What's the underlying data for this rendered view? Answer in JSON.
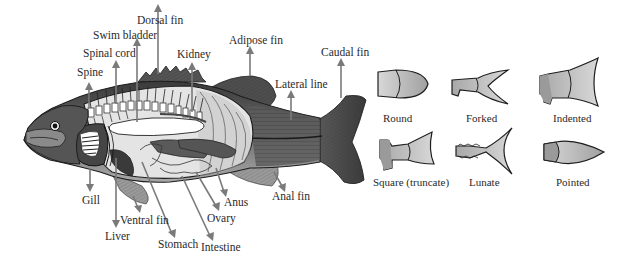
{
  "diagram": {
    "colors": {
      "background": "#ffffff",
      "label_text": "#2a2a2a",
      "arrow": "#7a7a7a",
      "fish_body_dark": "#4a4a4a",
      "fish_body_mid": "#8a8a8a",
      "body_cavity": "#e6e6e6",
      "organ_dark": "#3c3c3c",
      "fin_shape_fill": "#b8b8b8"
    },
    "anatomy_labels": {
      "dorsal_fin": "Dorsal fin",
      "swim_bladder": "Swim bladder",
      "spinal_cord": "Spinal cord",
      "spine": "Spine",
      "kidney": "Kidney",
      "adipose_fin": "Adipose fin",
      "caudal_fin": "Caudal fin",
      "lateral_line": "Lateral line",
      "gill": "Gill",
      "ventral_fin": "Ventral fin",
      "liver": "Liver",
      "stomach": "Stomach",
      "intestine": "Intestine",
      "ovary": "Ovary",
      "anus": "Anus",
      "anal_fin": "Anal fin"
    },
    "caudal_fin_shapes": [
      {
        "id": "round",
        "label": "Round"
      },
      {
        "id": "forked",
        "label": "Forked"
      },
      {
        "id": "indented",
        "label": "Indented"
      },
      {
        "id": "square",
        "label": "Square (truncate)"
      },
      {
        "id": "lunate",
        "label": "Lunate"
      },
      {
        "id": "pointed",
        "label": "Pointed"
      }
    ]
  }
}
